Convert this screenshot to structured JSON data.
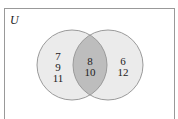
{
  "diagram": {
    "type": "venn",
    "universe_label": "U",
    "regions": {
      "left_only": [
        "7",
        "9",
        "11"
      ],
      "intersection": [
        "8",
        "10"
      ],
      "right_only": [
        "6",
        "12"
      ]
    },
    "colors": {
      "border": "#999999",
      "circle_fill": "#ebebeb",
      "circle_stroke": "#9a9a9a",
      "intersection_fill": "#bdbdbd",
      "text": "#222222"
    }
  }
}
